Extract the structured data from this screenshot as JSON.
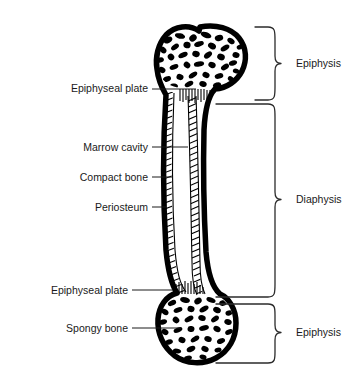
{
  "figure": {
    "background_color": "#ffffff",
    "ink_color": "#000000",
    "label_color": "#1a1a1a",
    "bracket_color": "#2b2b2b"
  },
  "left_labels": [
    {
      "id": "epiphyseal-plate-proximal",
      "text": "Epiphyseal plate",
      "x": 148,
      "y": 88,
      "leader_to_x": 196,
      "leader_to_y": 90
    },
    {
      "id": "marrow-cavity",
      "text": "Marrow cavity",
      "x": 148,
      "y": 147,
      "leader_to_x": 188,
      "leader_to_y": 147
    },
    {
      "id": "compact-bone",
      "text": "Compact bone",
      "x": 148,
      "y": 177,
      "leader_to_x": 173,
      "leader_to_y": 177
    },
    {
      "id": "periosteum",
      "text": "Periosteum",
      "x": 148,
      "y": 207,
      "leader_to_x": 166,
      "leader_to_y": 207
    },
    {
      "id": "epiphyseal-plate-distal",
      "text": "Epiphyseal plate",
      "x": 128,
      "y": 290,
      "leader_to_x": 173,
      "leader_to_y": 290
    },
    {
      "id": "spongy-bone",
      "text": "Spongy bone",
      "x": 128,
      "y": 328,
      "leader_to_x": 181,
      "leader_to_y": 328
    }
  ],
  "right_labels": [
    {
      "id": "epiphysis-proximal",
      "text": "Epiphysis",
      "x": 296,
      "y": 66,
      "span_top": 27,
      "span_bottom": 100
    },
    {
      "id": "diaphysis",
      "text": "Diaphysis",
      "x": 296,
      "y": 202,
      "span_top": 104,
      "span_bottom": 297
    },
    {
      "id": "epiphysis-distal",
      "text": "Epiphysis",
      "x": 296,
      "y": 333,
      "span_top": 304,
      "span_bottom": 363
    }
  ],
  "bone_parts": [
    {
      "id": "proximal-epiphysis",
      "name": "proximal epiphysis",
      "region": "head"
    },
    {
      "id": "diaphysis-shaft",
      "name": "diaphysis shaft",
      "region": "shaft"
    },
    {
      "id": "distal-epiphysis",
      "name": "distal epiphysis",
      "region": "base"
    },
    {
      "id": "marrow-cavity-area",
      "name": "marrow cavity",
      "region": "interior"
    },
    {
      "id": "compact-bone-band",
      "name": "compact bone",
      "region": "cortex"
    },
    {
      "id": "periosteum-layer",
      "name": "periosteum",
      "region": "outer membrane"
    }
  ]
}
